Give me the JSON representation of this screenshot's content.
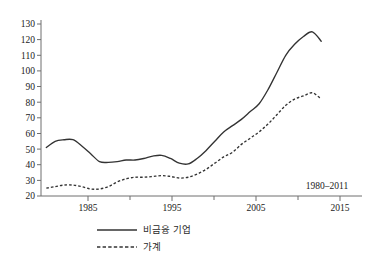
{
  "chart_data": {
    "type": "line",
    "title": "",
    "subtitle": "",
    "xlabel": "",
    "ylabel": "",
    "annotation": "1980–2011",
    "xlim": [
      1979.4,
      2015.6
    ],
    "ylim": [
      20,
      130
    ],
    "grid": false,
    "legend_position": "bottom",
    "x_ticks_major": [
      1985,
      1995,
      2005,
      2015
    ],
    "x_ticks_minor": [
      1990,
      2000,
      2010
    ],
    "x_tick_labels": [
      "1985",
      "1995",
      "2005",
      "2015"
    ],
    "y_ticks": [
      20,
      30,
      40,
      50,
      60,
      70,
      80,
      90,
      100,
      110,
      120,
      130
    ],
    "y_tick_labels": [
      "20",
      "30",
      "40",
      "50",
      "60",
      "70",
      "80",
      "90",
      "100",
      "110",
      "120",
      "130"
    ],
    "x": [
      1980,
      1981,
      1982,
      1983,
      1984,
      1985,
      1986,
      1987,
      1988,
      1989,
      1990,
      1991,
      1992,
      1993,
      1994,
      1995,
      1996,
      1997,
      1998,
      1999,
      2000,
      2001,
      2002,
      2003,
      2004,
      2005,
      2006,
      2007,
      2008,
      2009,
      2010,
      2011
    ],
    "series": [
      {
        "name": "비금융 기업",
        "style": "solid",
        "color": "#333333",
        "values": [
          51,
          55,
          56,
          56,
          52,
          47,
          42,
          41.5,
          42,
          43,
          43,
          44,
          45.5,
          46,
          44,
          41,
          40.5,
          44,
          49,
          55,
          61,
          65,
          69,
          74,
          79,
          88,
          99,
          110,
          117,
          122,
          125,
          119
        ]
      },
      {
        "name": "가계",
        "style": "dashed",
        "color": "#333333",
        "values": [
          25,
          26,
          27,
          27,
          26,
          24.5,
          24.5,
          26,
          29,
          31,
          32,
          32,
          32.5,
          33,
          32.5,
          31.5,
          32,
          34,
          37,
          41,
          45,
          48,
          53,
          57,
          61,
          66,
          72,
          78,
          82,
          84,
          86,
          82
        ]
      }
    ]
  },
  "legend": {
    "entries": [
      {
        "label": "비금융 기업",
        "style": "solid"
      },
      {
        "label": "가계",
        "style": "dashed"
      }
    ]
  },
  "axes": {
    "y_labels": [
      "130",
      "120",
      "110",
      "100",
      "90",
      "80",
      "70",
      "60",
      "50",
      "40",
      "30",
      "20"
    ],
    "x_labels": [
      "1985",
      "1995",
      "2005",
      "2015"
    ]
  },
  "annotation": {
    "range_label": "1980–2011"
  }
}
